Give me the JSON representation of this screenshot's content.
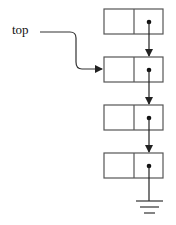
{
  "diagram": {
    "type": "linked-list-stack",
    "pointer_label": "top",
    "node_count": 4,
    "nodes": [
      {
        "index": 0,
        "fields": [
          "data",
          "next"
        ],
        "next": "node-1"
      },
      {
        "index": 1,
        "fields": [
          "data",
          "next"
        ],
        "next": "node-2",
        "pointed_by": "top"
      },
      {
        "index": 2,
        "fields": [
          "data",
          "next"
        ],
        "next": "node-3"
      },
      {
        "index": 3,
        "fields": [
          "data",
          "next"
        ],
        "next": "null-ground"
      }
    ],
    "terminator": "ground-symbol",
    "colors": {
      "stroke": "#333333",
      "background": "#ffffff"
    }
  }
}
